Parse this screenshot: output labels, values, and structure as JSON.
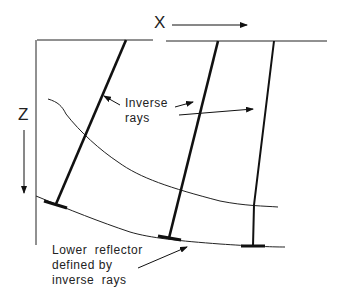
{
  "axes": {
    "x_label": "X",
    "z_label": "Z"
  },
  "annotations": {
    "inverse_rays_line1": "Inverse",
    "inverse_rays_line2": "rays",
    "lower_reflector_line1": "Lower  reflector",
    "lower_reflector_line2": "defined by",
    "lower_reflector_line3": "inverse  rays"
  },
  "colors": {
    "ink": "#111111",
    "background": "#ffffff"
  }
}
